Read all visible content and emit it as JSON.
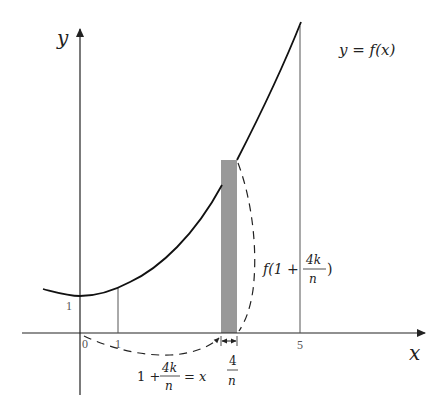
{
  "diagram": {
    "type": "riemann-sum-illustration",
    "axes": {
      "x_label": "x",
      "y_label": "y"
    },
    "curve_label": "y = f(x)",
    "ticks": {
      "origin": "0",
      "x_one": "1",
      "x_five": "5",
      "y_one": "1"
    },
    "annotations": {
      "sample_point_lhs": "1 +",
      "sample_point_num": "4k",
      "sample_point_den": "n",
      "sample_point_rhs": "= x",
      "width_num": "4",
      "width_den": "n",
      "height_prefix": "f(1 +",
      "height_num": "4k",
      "height_den": "n",
      "height_suffix": ")"
    },
    "colors": {
      "axis": "#222222",
      "curve": "#111111",
      "rectangle": "#999999",
      "guide_lines": "#555555",
      "dashed": "#222222"
    }
  }
}
